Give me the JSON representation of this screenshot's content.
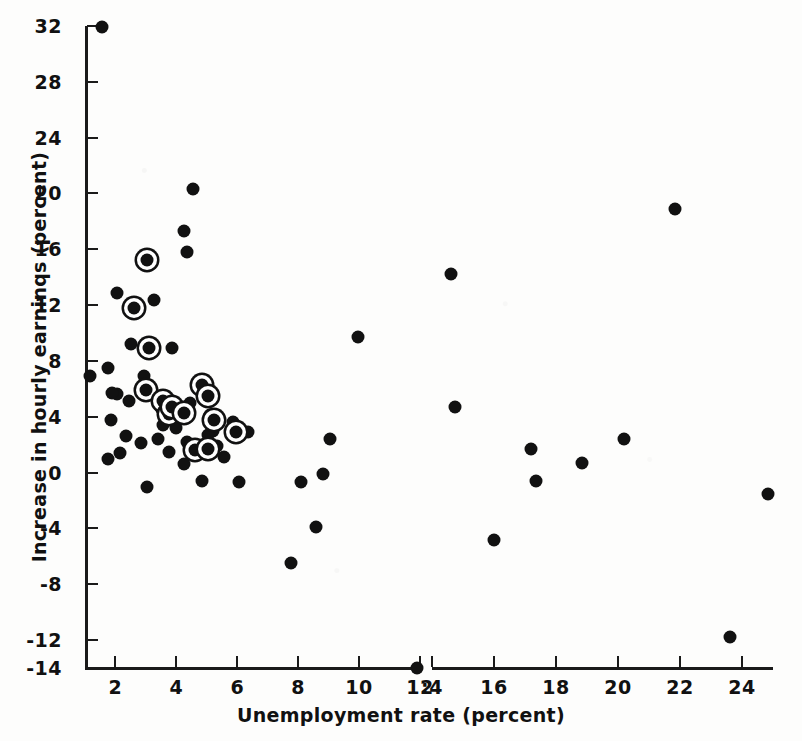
{
  "chart_data": {
    "type": "scatter",
    "title": "",
    "xlabel": "Unemployment rate (percent)",
    "ylabel": "Increase in hourly earninqs (percent)",
    "xlim": [
      1,
      25
    ],
    "ylim": [
      -14,
      32
    ],
    "grid": false,
    "legend": "none",
    "axis_break": {
      "after": 12,
      "before": 14,
      "note": "x-axis line is broken between the 12 and 14 ticks"
    },
    "xticks": [
      2,
      4,
      6,
      8,
      10,
      12,
      14,
      16,
      18,
      20,
      22,
      24
    ],
    "xtick_labels": [
      "2",
      "4",
      "6",
      "8",
      "10",
      "12",
      ":4",
      "16",
      "18",
      "20",
      "22",
      "24"
    ],
    "yticks": [
      32,
      28,
      24,
      20,
      16,
      12,
      8,
      4,
      0,
      -4,
      -8,
      -12,
      -14
    ],
    "ytick_labels": [
      "32",
      "28",
      "24",
      "20",
      "16",
      "12",
      "8",
      "4",
      "0",
      "-4",
      "-8",
      "-12",
      "-14"
    ],
    "marker_color": "#111111",
    "series": [
      {
        "name": "plain",
        "marker": "filled-circle",
        "points": [
          [
            1.55,
            31.9
          ],
          [
            1.15,
            6.9
          ],
          [
            1.75,
            7.5
          ],
          [
            2.05,
            12.9
          ],
          [
            1.85,
            3.8
          ],
          [
            1.75,
            1.0
          ],
          [
            2.15,
            1.4
          ],
          [
            4.55,
            20.3
          ],
          [
            4.25,
            17.3
          ],
          [
            4.35,
            15.8
          ],
          [
            2.6,
            11.7
          ],
          [
            3.25,
            12.4
          ],
          [
            2.5,
            9.2
          ],
          [
            3.85,
            8.9
          ],
          [
            2.45,
            5.1
          ],
          [
            2.95,
            6.9
          ],
          [
            2.85,
            2.1
          ],
          [
            3.4,
            2.4
          ],
          [
            2.35,
            2.6
          ],
          [
            2.05,
            5.6
          ],
          [
            1.9,
            5.7
          ],
          [
            3.05,
            -1.0
          ],
          [
            3.6,
            5.0
          ],
          [
            3.5,
            4.6
          ],
          [
            3.95,
            4.8
          ],
          [
            4.1,
            4.6
          ],
          [
            4.0,
            3.2
          ],
          [
            3.55,
            3.4
          ],
          [
            4.45,
            5.0
          ],
          [
            4.75,
            6.3
          ],
          [
            3.75,
            1.5
          ],
          [
            4.35,
            2.2
          ],
          [
            4.55,
            1.4
          ],
          [
            4.25,
            0.6
          ],
          [
            5.1,
            4.1
          ],
          [
            5.2,
            3.0
          ],
          [
            5.35,
            1.9
          ],
          [
            5.05,
            2.7
          ],
          [
            4.85,
            -0.6
          ],
          [
            5.85,
            3.6
          ],
          [
            5.55,
            1.1
          ],
          [
            6.35,
            2.9
          ],
          [
            6.05,
            -0.7
          ],
          [
            7.75,
            -6.5
          ],
          [
            8.1,
            -0.7
          ],
          [
            8.6,
            -3.9
          ],
          [
            8.8,
            -0.1
          ],
          [
            9.05,
            2.4
          ],
          [
            9.95,
            9.7
          ],
          [
            11.9,
            -14.0
          ],
          [
            14.6,
            14.2
          ],
          [
            14.75,
            4.7
          ],
          [
            16.0,
            -4.8
          ],
          [
            17.2,
            1.7
          ],
          [
            17.35,
            -0.6
          ],
          [
            18.85,
            0.7
          ],
          [
            20.2,
            2.4
          ],
          [
            21.85,
            18.9
          ],
          [
            23.6,
            -11.8
          ],
          [
            24.85,
            -1.5
          ]
        ]
      },
      {
        "name": "circled",
        "marker": "filled-circle-with-ring",
        "points": [
          [
            3.05,
            15.2
          ],
          [
            2.6,
            11.8
          ],
          [
            3.1,
            8.9
          ],
          [
            3.0,
            5.9
          ],
          [
            3.55,
            5.1
          ],
          [
            3.75,
            4.2
          ],
          [
            3.85,
            4.7
          ],
          [
            4.25,
            4.3
          ],
          [
            4.85,
            6.3
          ],
          [
            5.05,
            5.5
          ],
          [
            5.25,
            3.8
          ],
          [
            4.6,
            1.6
          ],
          [
            5.95,
            2.9
          ],
          [
            5.05,
            1.7
          ]
        ]
      }
    ]
  },
  "figure": {
    "background": "#fdfdfc",
    "ink_color": "#111111",
    "corner_mark": ""
  }
}
